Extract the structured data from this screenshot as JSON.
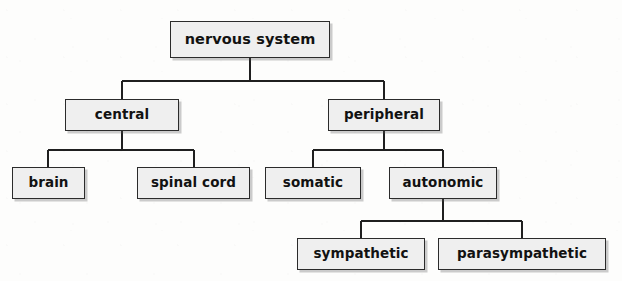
{
  "diagram": {
    "type": "tree",
    "canvas": {
      "width": 622,
      "height": 281
    },
    "style": {
      "box_fill": "#efefef",
      "box_border": "#2b2b2b",
      "text_color": "#121212",
      "connector_color": "#1f1f1f",
      "background": "#fdfdfc"
    },
    "nodes": [
      {
        "id": "nervous-system",
        "label": "nervous system",
        "level": 0,
        "x": 170,
        "y": 21,
        "w": 160,
        "h": 37,
        "font_size": 14.5,
        "parent": null
      },
      {
        "id": "central",
        "label": "central",
        "level": 1,
        "x": 65,
        "y": 99,
        "w": 114,
        "h": 32,
        "font_size": 13.5,
        "parent": "nervous-system"
      },
      {
        "id": "peripheral",
        "label": "peripheral",
        "level": 1,
        "x": 328,
        "y": 99,
        "w": 112,
        "h": 32,
        "font_size": 13.5,
        "parent": "nervous-system"
      },
      {
        "id": "brain",
        "label": "brain",
        "level": 2,
        "x": 12,
        "y": 167,
        "w": 73,
        "h": 32,
        "font_size": 13.5,
        "parent": "central"
      },
      {
        "id": "spinal-cord",
        "label": "spinal cord",
        "level": 2,
        "x": 137,
        "y": 167,
        "w": 113,
        "h": 32,
        "font_size": 13.5,
        "parent": "central"
      },
      {
        "id": "somatic",
        "label": "somatic",
        "level": 2,
        "x": 265,
        "y": 167,
        "w": 96,
        "h": 32,
        "font_size": 13.5,
        "parent": "peripheral"
      },
      {
        "id": "autonomic",
        "label": "autonomic",
        "level": 2,
        "x": 389,
        "y": 167,
        "w": 108,
        "h": 32,
        "font_size": 13.5,
        "parent": "peripheral"
      },
      {
        "id": "sympathetic",
        "label": "sympathetic",
        "level": 3,
        "x": 297,
        "y": 238,
        "w": 128,
        "h": 32,
        "font_size": 13.5,
        "parent": "autonomic"
      },
      {
        "id": "parasympathetic",
        "label": "parasympathetic",
        "level": 3,
        "x": 438,
        "y": 238,
        "w": 168,
        "h": 32,
        "font_size": 13.5,
        "parent": "autonomic"
      }
    ],
    "connectors": [
      {
        "id": "conn-root-stem",
        "from": "nervous-system",
        "points": "250,58 250,81"
      },
      {
        "id": "conn-root-bus",
        "from": "nervous-system",
        "points": "122,81 384,81"
      },
      {
        "id": "conn-central-drop",
        "to": "central",
        "points": "122,81 122,99"
      },
      {
        "id": "conn-peripheral-drop",
        "to": "peripheral",
        "points": "384,81 384,99"
      },
      {
        "id": "conn-central-stem",
        "from": "central",
        "points": "122,131 122,150"
      },
      {
        "id": "conn-central-bus",
        "from": "central",
        "points": "48,150 194,150"
      },
      {
        "id": "conn-brain-drop",
        "to": "brain",
        "points": "48,150 48,167"
      },
      {
        "id": "conn-spinal-drop",
        "to": "spinal-cord",
        "points": "194,150 194,167"
      },
      {
        "id": "conn-peripheral-stem",
        "from": "peripheral",
        "points": "384,131 384,150"
      },
      {
        "id": "conn-peripheral-bus",
        "from": "peripheral",
        "points": "313,150 443,150"
      },
      {
        "id": "conn-somatic-drop",
        "to": "somatic",
        "points": "313,150 313,167"
      },
      {
        "id": "conn-autonomic-drop",
        "to": "autonomic",
        "points": "443,150 443,167"
      },
      {
        "id": "conn-autonomic-stem",
        "from": "autonomic",
        "points": "443,199 443,221"
      },
      {
        "id": "conn-autonomic-bus",
        "from": "autonomic",
        "points": "361,221 522,221"
      },
      {
        "id": "conn-sympathetic-drop",
        "to": "sympathetic",
        "points": "361,221 361,238"
      },
      {
        "id": "conn-parasymp-drop",
        "to": "parasympathetic",
        "points": "522,221 522,238"
      }
    ]
  }
}
